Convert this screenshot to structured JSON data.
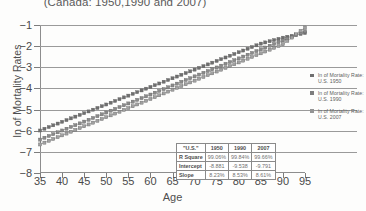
{
  "chart_data": {
    "type": "scatter",
    "title": "(Canada: 1950,1990 and 2007)",
    "xlabel": "Age",
    "ylabel": "ln of Mortality Rates",
    "xlim": [
      35,
      95
    ],
    "ylim": [
      -8,
      -1
    ],
    "xticks": [
      35,
      40,
      45,
      50,
      55,
      60,
      65,
      70,
      75,
      80,
      85,
      90,
      95
    ],
    "yticks": [
      -1,
      -2,
      -3,
      -4,
      -5,
      -6,
      -7,
      -8
    ],
    "grid": true,
    "legend_position": "right",
    "series": [
      {
        "name": "ln of Mortality Rate: U.S. 1950",
        "color": "#6f6f6f",
        "x": [
          35,
          40,
          45,
          50,
          55,
          60,
          65,
          70,
          75,
          80,
          85,
          90,
          95
        ],
        "y": [
          -5.99,
          -5.58,
          -5.17,
          -4.76,
          -4.34,
          -3.93,
          -3.52,
          -3.11,
          -2.7,
          -2.29,
          -1.88,
          -1.6,
          -1.38
        ]
      },
      {
        "name": "ln of Mortality Rate: U.S. 1990",
        "color": "#8a8a8a",
        "x": [
          35,
          40,
          45,
          50,
          55,
          60,
          65,
          70,
          75,
          80,
          85,
          90,
          95
        ],
        "y": [
          -6.42,
          -5.99,
          -5.57,
          -5.14,
          -4.71,
          -4.29,
          -3.86,
          -3.43,
          -3.01,
          -2.58,
          -2.15,
          -1.73,
          -1.3
        ]
      },
      {
        "name": "ln of Mortality Rate: U.S. 2007",
        "color": "#a0a0a0",
        "x": [
          35,
          40,
          45,
          50,
          55,
          60,
          65,
          70,
          75,
          80,
          85,
          90,
          95
        ],
        "y": [
          -6.65,
          -6.22,
          -5.79,
          -5.36,
          -4.93,
          -4.5,
          -4.06,
          -3.63,
          -3.2,
          -2.77,
          -2.34,
          -1.91,
          -1.12
        ]
      }
    ],
    "annotations": {
      "table_title": "\"U.S.\""
    }
  },
  "legend": {
    "items": [
      {
        "label_line1": "ln of Mortality Rate:",
        "label_line2": "U.S. 1950",
        "swatch": "#6f6f6f"
      },
      {
        "label_line1": "ln of Mortality Rate:",
        "label_line2": "U.S. 1990",
        "swatch": "#7d7d7d"
      },
      {
        "label_line1": "ln of Mortality Rate:",
        "label_line2": "U.S. 2007",
        "swatch": "#949494"
      }
    ]
  },
  "stats_table": {
    "corner_label": "\"U.S.\"",
    "columns": [
      "1950",
      "1990",
      "2007"
    ],
    "rows": [
      {
        "label": "R Square",
        "values": [
          "99.06%",
          "99.84%",
          "99.66%"
        ]
      },
      {
        "label": "Intercept",
        "values": [
          "-8.881",
          "-9.538",
          "-9.791"
        ]
      },
      {
        "label": "Slope",
        "values": [
          "8.23%",
          "8.53%",
          "8.61%"
        ]
      }
    ]
  }
}
